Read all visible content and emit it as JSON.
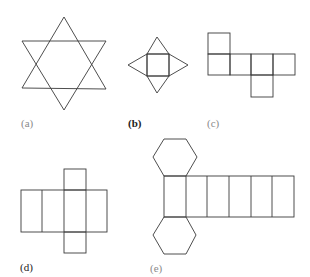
{
  "figures": [
    {
      "id": "a",
      "label": "(a)",
      "shape": "six-pointed star (hexagram)",
      "label_style": "light"
    },
    {
      "id": "b",
      "label": "(b)",
      "shape": "net of square pyramid",
      "label_style": "dark"
    },
    {
      "id": "c",
      "label": "(c)",
      "shape": "cube net (six squares)",
      "label_style": "light"
    },
    {
      "id": "d",
      "label": "(d)",
      "shape": "cube net (cross)",
      "label_style": "dark"
    },
    {
      "id": "e",
      "label": "(e)",
      "shape": "hexagonal prism net",
      "label_style": "light"
    }
  ],
  "colors": {
    "stroke": "#3a3a3a",
    "background": "#ffffff",
    "label_light": "#8a8a8a",
    "label_dark": "#222222"
  }
}
